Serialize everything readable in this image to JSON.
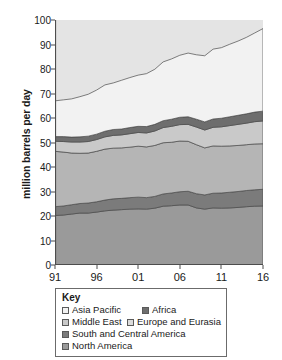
{
  "chart_data": {
    "type": "area",
    "stacked": true,
    "title": "",
    "xlabel": "",
    "ylabel": "million barrels per day",
    "xlim": [
      1991,
      2016
    ],
    "ylim": [
      0,
      100
    ],
    "ytick_step": 10,
    "ytick_labels": [
      "0",
      "10",
      "20",
      "30",
      "40",
      "50",
      "60",
      "70",
      "80",
      "90",
      "100"
    ],
    "xtick_labels": [
      "91",
      "96",
      "01",
      "06",
      "11",
      "16"
    ],
    "xtick_values": [
      1991,
      1996,
      2001,
      2006,
      2011,
      2016
    ],
    "grid": false,
    "legend_position": "below-plot",
    "legend_title": "Key",
    "x": [
      1991,
      1992,
      1993,
      1994,
      1995,
      1996,
      1997,
      1998,
      1999,
      2000,
      2001,
      2002,
      2003,
      2004,
      2005,
      2006,
      2007,
      2008,
      2009,
      2010,
      2011,
      2012,
      2013,
      2014,
      2015,
      2016
    ],
    "series": [
      {
        "name": "North America",
        "color": "#9a9a9a",
        "stack_order": 1,
        "values": [
          20.2,
          20.4,
          20.8,
          21.2,
          21.2,
          21.6,
          22.1,
          22.4,
          22.6,
          22.8,
          22.9,
          22.8,
          23.2,
          24.0,
          24.2,
          24.5,
          24.5,
          23.3,
          22.8,
          23.3,
          23.2,
          23.3,
          23.5,
          23.8,
          24.0,
          24.1
        ]
      },
      {
        "name": "South and Central America",
        "color": "#7b7b7b",
        "stack_order": 2,
        "values": [
          3.6,
          3.7,
          3.8,
          3.9,
          4.1,
          4.2,
          4.4,
          4.6,
          4.6,
          4.7,
          4.8,
          4.7,
          4.8,
          5.0,
          5.2,
          5.4,
          5.6,
          5.8,
          5.8,
          6.0,
          6.2,
          6.4,
          6.5,
          6.6,
          6.7,
          6.8
        ]
      },
      {
        "name": "Europe and Eurasia",
        "color": "#b5b5b5",
        "stack_order": 3,
        "values": [
          22.6,
          22.0,
          21.1,
          20.5,
          20.4,
          20.6,
          20.8,
          20.7,
          20.6,
          20.6,
          20.8,
          20.7,
          20.8,
          20.9,
          20.7,
          20.7,
          20.4,
          20.0,
          19.2,
          19.3,
          19.1,
          18.9,
          18.8,
          18.7,
          18.7,
          18.6
        ]
      },
      {
        "name": "Middle East",
        "color": "#c9c9c9",
        "stack_order": 4,
        "values": [
          4.1,
          4.3,
          4.5,
          4.6,
          4.7,
          4.8,
          5.0,
          5.2,
          5.3,
          5.5,
          5.6,
          5.7,
          5.9,
          6.2,
          6.5,
          6.7,
          6.9,
          7.2,
          7.3,
          7.6,
          7.9,
          8.3,
          8.6,
          8.8,
          9.1,
          9.3
        ]
      },
      {
        "name": "Africa",
        "color": "#6e6e6e",
        "stack_order": 5,
        "values": [
          1.9,
          2.0,
          2.0,
          2.1,
          2.2,
          2.2,
          2.3,
          2.4,
          2.4,
          2.5,
          2.5,
          2.6,
          2.7,
          2.8,
          2.9,
          3.0,
          3.1,
          3.2,
          3.3,
          3.4,
          3.5,
          3.6,
          3.7,
          3.8,
          3.9,
          4.0
        ]
      },
      {
        "name": "Asia Pacific",
        "color": "#f2f2f2",
        "stack_order": 6,
        "values": [
          14.6,
          15.0,
          15.6,
          16.4,
          17.1,
          18.0,
          18.9,
          19.0,
          19.9,
          20.4,
          20.9,
          21.6,
          22.5,
          24.0,
          24.6,
          25.3,
          26.0,
          26.3,
          27.0,
          28.5,
          28.8,
          29.6,
          30.3,
          31.2,
          32.3,
          33.7
        ]
      }
    ],
    "totals": [
      67.0,
      67.4,
      67.8,
      68.7,
      69.7,
      71.4,
      73.5,
      74.3,
      75.4,
      76.5,
      77.5,
      78.1,
      79.9,
      82.9,
      84.1,
      85.6,
      86.5,
      85.8,
      85.4,
      88.1,
      88.7,
      90.1,
      91.4,
      92.9,
      94.7,
      96.5
    ]
  },
  "legend": {
    "title": "Key",
    "entries": [
      {
        "label": "Asia Pacific",
        "color": "#f2f2f2"
      },
      {
        "label": "Africa",
        "color": "#6e6e6e"
      },
      {
        "label": "Middle East",
        "color": "#c9c9c9"
      },
      {
        "label": "Europe and Eurasia",
        "color": "#dcdcdc"
      },
      {
        "label": "South and Central America",
        "color": "#7b7b7b"
      },
      {
        "label": "North America",
        "color": "#9a9a9a"
      }
    ]
  },
  "axis": {
    "y_title": "million barrels per day"
  }
}
